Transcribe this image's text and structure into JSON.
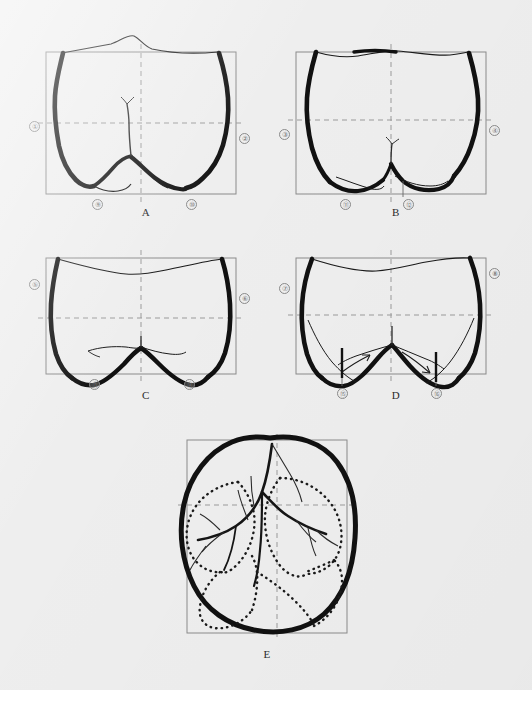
{
  "figure": {
    "type": "dental-anatomy-line-drawing",
    "background_color": "#eeeeee",
    "ink_color": "#101010",
    "frame_color": "#8a8a8a",
    "dash_color": "#9a9a9a",
    "panel_count": 5
  },
  "panels": [
    {
      "id": "A",
      "label": "A",
      "view": "buccal",
      "frame": {
        "x": 46,
        "y": 52,
        "w": 190,
        "h": 142
      },
      "numbers": [
        {
          "id": "1",
          "glyph": "①",
          "x": 29,
          "y": 121
        },
        {
          "id": "2",
          "glyph": "②",
          "x": 239,
          "y": 133
        },
        {
          "id": "9",
          "glyph": "⑨",
          "x": 92,
          "y": 199
        },
        {
          "id": "10",
          "glyph": "⑩",
          "x": 186,
          "y": 199
        }
      ]
    },
    {
      "id": "B",
      "label": "B",
      "view": "lingual",
      "frame": {
        "x": 296,
        "y": 52,
        "w": 190,
        "h": 142
      },
      "numbers": [
        {
          "id": "3",
          "glyph": "③",
          "x": 279,
          "y": 129
        },
        {
          "id": "4",
          "glyph": "④",
          "x": 489,
          "y": 125
        },
        {
          "id": "11",
          "glyph": "⑪",
          "x": 340,
          "y": 199
        },
        {
          "id": "12",
          "glyph": "⑫",
          "x": 403,
          "y": 199
        }
      ]
    },
    {
      "id": "C",
      "label": "C",
      "view": "mesial",
      "frame": {
        "x": 46,
        "y": 258,
        "w": 190,
        "h": 116
      },
      "numbers": [
        {
          "id": "5",
          "glyph": "⑤",
          "x": 29,
          "y": 279
        },
        {
          "id": "6",
          "glyph": "⑥",
          "x": 239,
          "y": 293
        },
        {
          "id": "13",
          "glyph": "⑬",
          "x": 89,
          "y": 379
        },
        {
          "id": "14",
          "glyph": "⑭",
          "x": 184,
          "y": 379
        }
      ]
    },
    {
      "id": "D",
      "label": "D",
      "view": "distal",
      "frame": {
        "x": 296,
        "y": 258,
        "w": 190,
        "h": 116
      },
      "numbers": [
        {
          "id": "7",
          "glyph": "⑦",
          "x": 279,
          "y": 283
        },
        {
          "id": "8",
          "glyph": "⑧",
          "x": 489,
          "y": 268
        },
        {
          "id": "15",
          "glyph": "⑮",
          "x": 340,
          "y": 388
        },
        {
          "id": "16",
          "glyph": "⑯",
          "x": 431,
          "y": 388
        }
      ]
    },
    {
      "id": "E",
      "label": "E",
      "view": "occlusal",
      "frame": {
        "x": 187,
        "y": 440,
        "w": 160,
        "h": 193
      },
      "numbers": []
    }
  ],
  "panel_labels": [
    {
      "text": "A",
      "x": 131,
      "y": 206
    },
    {
      "text": "B",
      "x": 381,
      "y": 206
    },
    {
      "text": "C",
      "x": 131,
      "y": 389
    },
    {
      "text": "D",
      "x": 381,
      "y": 389
    },
    {
      "text": "E",
      "x": 252,
      "y": 648
    }
  ]
}
